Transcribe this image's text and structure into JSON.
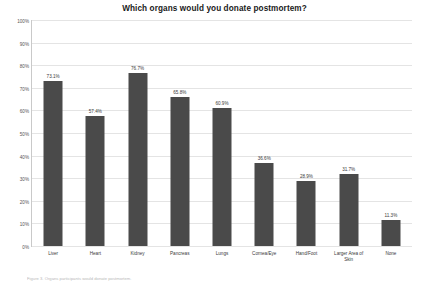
{
  "chart_data": {
    "type": "bar",
    "title": "Which organs would you donate postmortem?",
    "xlabel": "",
    "ylabel": "",
    "categories": [
      "Liver",
      "Heart",
      "Kidney",
      "Pancreas",
      "Lungs",
      "Cornea/Eye",
      "Hand/Foot",
      "Larger Area of\nSkin",
      "None"
    ],
    "values": [
      73.1,
      57.4,
      76.7,
      65.8,
      60.9,
      36.6,
      28.9,
      31.7,
      11.3
    ],
    "value_labels": [
      "73.1%",
      "57.4%",
      "76.7%",
      "65.8%",
      "60.9%",
      "36.6%",
      "28.9%",
      "31.7%",
      "11.3%"
    ],
    "ylim": [
      0,
      100
    ],
    "ytick_labels": [
      "100%",
      "90%",
      "80%",
      "70%",
      "60%",
      "50%",
      "40%",
      "30%",
      "20%",
      "10%",
      "0%"
    ],
    "ytick_values": [
      100,
      90,
      80,
      70,
      60,
      50,
      40,
      30,
      20,
      10,
      0
    ],
    "grid": true,
    "legend": false,
    "bar_color": "#4a4a4a",
    "grid_color": "#e4e4e4",
    "axis_color": "#c9c9c9"
  },
  "caption": {
    "text": "Figure 3. Organs participants would donate postmortem."
  }
}
